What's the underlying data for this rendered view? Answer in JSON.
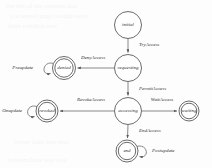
{
  "diagram": {
    "type": "state-diagram",
    "background_color": "#fdfdfd",
    "stroke_color": "#5a5a5a",
    "text_color": "#333333",
    "nodes": [
      {
        "id": "initial",
        "label": "initial",
        "cx": 128,
        "cy": 25,
        "r": 13.5,
        "final": false
      },
      {
        "id": "requesting",
        "label": "requesting",
        "cx": 128,
        "cy": 68,
        "r": 13.5,
        "final": false
      },
      {
        "id": "denied",
        "label": "denied",
        "cx": 64,
        "cy": 68,
        "r": 11.5,
        "final": true
      },
      {
        "id": "accessing",
        "label": "accessing",
        "cx": 128,
        "cy": 111,
        "r": 13.5,
        "final": false
      },
      {
        "id": "revoked",
        "label": "revoked",
        "cx": 47,
        "cy": 111,
        "r": 11.0,
        "final": true
      },
      {
        "id": "waiting",
        "label": "waiting",
        "cx": 189,
        "cy": 111,
        "r": 10.0,
        "final": true
      },
      {
        "id": "end",
        "label": "end",
        "cx": 127,
        "cy": 151,
        "r": 11.0,
        "final": true
      }
    ],
    "edges": [
      {
        "id": "try-access",
        "label": "TryAccess",
        "from": "initial",
        "to": "requesting",
        "label_x": 139,
        "label_y": 44,
        "anchor": "start"
      },
      {
        "id": "deny-access",
        "label": "DenyAccess",
        "from": "requesting",
        "to": "denied",
        "label_x": 92,
        "label_y": 58,
        "anchor": "middle"
      },
      {
        "id": "permit-access",
        "label": "PermitAccess",
        "from": "requesting",
        "to": "accessing",
        "label_x": 139,
        "label_y": 88,
        "anchor": "start"
      },
      {
        "id": "revoke-access",
        "label": "RevokeAccess",
        "from": "accessing",
        "to": "revoked",
        "label_x": 91,
        "label_y": 100,
        "anchor": "middle"
      },
      {
        "id": "wait-access",
        "label": "WaitAccess",
        "from": "accessing",
        "to": "waiting",
        "label_x": 162,
        "label_y": 100,
        "anchor": "middle"
      },
      {
        "id": "end-access",
        "label": "EndAccess",
        "from": "accessing",
        "to": "end",
        "label_x": 139,
        "label_y": 130,
        "anchor": "start"
      }
    ],
    "self_loops": [
      {
        "id": "preupdate",
        "label": "Preupdate",
        "node": "denied",
        "label_x": 29,
        "label_y": 68,
        "anchor": "end",
        "side": "left"
      },
      {
        "id": "onupdate",
        "label": "Onupdate",
        "node": "revoked",
        "label_x": 13,
        "label_y": 111,
        "anchor": "start",
        "side": "left"
      },
      {
        "id": "postupdate",
        "label": "Postupdate",
        "node": "end",
        "label_x": 154,
        "label_y": 151,
        "anchor": "start",
        "side": "right"
      }
    ],
    "watermark": [
      {
        "text": "the the of the content and",
        "x": 6,
        "y": 4
      },
      {
        "text": "a scanned page background",
        "x": 10,
        "y": 14
      },
      {
        "text": "faint residual text",
        "x": 8,
        "y": 24
      },
      {
        "text": "lower faint line text",
        "x": 14,
        "y": 140
      },
      {
        "text": "bottom faint text row",
        "x": 8,
        "y": 158
      }
    ]
  }
}
